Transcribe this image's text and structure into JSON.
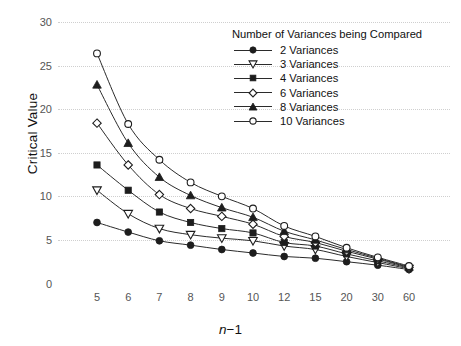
{
  "chart_data": {
    "type": "line",
    "title": "",
    "xlabel": "n−1",
    "ylabel": "Critical Value",
    "categories": [
      "5",
      "6",
      "7",
      "8",
      "9",
      "10",
      "12",
      "15",
      "20",
      "30",
      "60"
    ],
    "ylim": [
      0,
      30
    ],
    "yticks": [
      0,
      5,
      10,
      15,
      20,
      25,
      30
    ],
    "grid": true,
    "legend_position": "top-right",
    "legend_title": "Number of Variances being Compared",
    "series": [
      {
        "name": "2 Variances",
        "marker": "filled-circle",
        "values": [
          7.0,
          5.9,
          4.9,
          4.4,
          3.9,
          3.5,
          3.1,
          2.9,
          2.5,
          2.1,
          1.6
        ]
      },
      {
        "name": "3 Variances",
        "marker": "open-triangle-down",
        "values": [
          10.7,
          8.0,
          6.3,
          5.6,
          5.2,
          4.9,
          4.3,
          3.9,
          3.1,
          2.4,
          1.7
        ]
      },
      {
        "name": "4 Variances",
        "marker": "filled-square",
        "values": [
          13.6,
          10.7,
          8.2,
          7.0,
          6.3,
          5.8,
          4.7,
          4.3,
          3.4,
          2.6,
          1.8
        ]
      },
      {
        "name": "6 Variances",
        "marker": "open-diamond",
        "values": [
          18.4,
          13.6,
          10.2,
          8.6,
          7.7,
          6.8,
          5.4,
          4.7,
          3.7,
          2.8,
          1.85
        ]
      },
      {
        "name": "8 Variances",
        "marker": "filled-triangle-up",
        "values": [
          22.8,
          16.1,
          12.2,
          10.1,
          8.7,
          7.6,
          6.0,
          5.0,
          3.9,
          2.9,
          1.9
        ]
      },
      {
        "name": "10 Variances",
        "marker": "open-circle",
        "values": [
          26.4,
          18.3,
          14.2,
          11.6,
          10.0,
          8.6,
          6.6,
          5.4,
          4.1,
          3.0,
          2.0
        ]
      }
    ]
  },
  "axes": {
    "y_title": "Critical Value",
    "x_title_html": "n−1",
    "x_title_italic_part": "n",
    "x_title_rest": "−1"
  },
  "colors": {
    "line": "#2b2b2b",
    "grid": "#cfcfcf",
    "tick_text": "#555555",
    "axis_text": "#111111",
    "background": "#ffffff"
  }
}
